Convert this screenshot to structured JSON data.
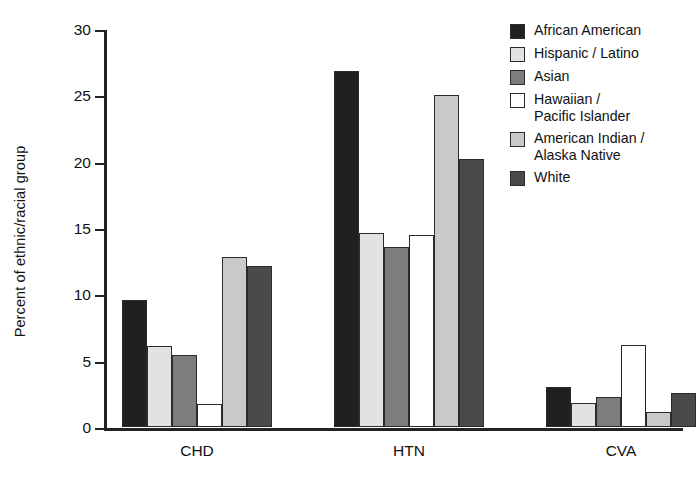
{
  "chart_data": {
    "type": "bar",
    "title": "",
    "xlabel": "",
    "ylabel": "Percent of ethnic/racial group",
    "categories": [
      "CHD",
      "HTN",
      "CVA"
    ],
    "ylim": [
      0,
      30
    ],
    "yticks": [
      0,
      5,
      10,
      15,
      20,
      25,
      30
    ],
    "grid": false,
    "legend_position": "right",
    "series": [
      {
        "name": "African American",
        "legend_label": "African American",
        "color": "#221f1f",
        "values": [
          9.6,
          26.8,
          3.0
        ]
      },
      {
        "name": "Hispanic / Latino",
        "legend_label": "Hispanic / Latino",
        "color": "#e2e2e2",
        "values": [
          6.1,
          14.6,
          1.8
        ]
      },
      {
        "name": "Asian",
        "legend_label": "Asian",
        "color": "#7d7d7d",
        "values": [
          5.4,
          13.6,
          2.3
        ]
      },
      {
        "name": "Hawaiian / Pacific Islander",
        "legend_label": "Hawaiian /\nPacific Islander",
        "color": "#ffffff",
        "values": [
          1.7,
          14.5,
          6.2
        ]
      },
      {
        "name": "American Indian / Alaska Native",
        "legend_label": "American Indian /\nAlaska Native",
        "color": "#c9c9c9",
        "values": [
          12.8,
          25.0,
          1.1
        ]
      },
      {
        "name": "White",
        "legend_label": "White",
        "color": "#4a4a4a",
        "values": [
          12.1,
          20.2,
          2.6
        ]
      }
    ]
  }
}
